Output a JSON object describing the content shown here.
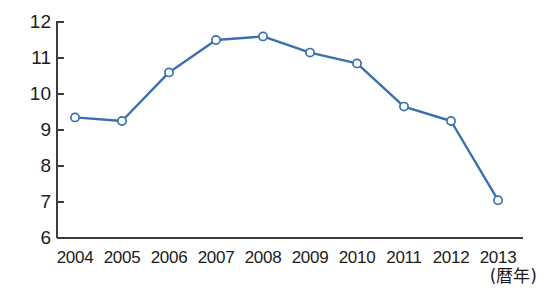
{
  "chart_data": {
    "type": "line",
    "title": "",
    "subtitle": "",
    "xlabel": "(暦年)",
    "ylabel": "",
    "categories": [
      "2004",
      "2005",
      "2006",
      "2007",
      "2008",
      "2009",
      "2010",
      "2011",
      "2012",
      "2013"
    ],
    "values": [
      9.35,
      9.25,
      10.6,
      11.5,
      11.6,
      11.15,
      10.85,
      9.65,
      9.25,
      7.05
    ],
    "series": [
      {
        "name": "",
        "values": [
          9.35,
          9.25,
          10.6,
          11.5,
          11.6,
          11.15,
          10.85,
          9.65,
          9.25,
          7.05
        ]
      }
    ],
    "ylim": [
      6,
      12
    ],
    "ytick_labels": [
      "12",
      "11",
      "10",
      "9",
      "8",
      "7",
      "6"
    ],
    "ytick_values": [
      12,
      11,
      10,
      9,
      8,
      7,
      6
    ],
    "xtick_labels": [
      "2004",
      "2005",
      "2006",
      "2007",
      "2008",
      "2009",
      "2010",
      "2011",
      "2012",
      "2013"
    ],
    "grid": false,
    "legend": false,
    "legend_position": "none",
    "annotations": [],
    "colors": {
      "line": "#3a6fb0",
      "marker_fill": "#ffffff",
      "marker_stroke": "#3a6fb0",
      "axis": "#3c3c3c",
      "text": "#1b1b1b",
      "background": "#ffffff"
    }
  },
  "axis_title": {
    "x": "(暦年)"
  }
}
